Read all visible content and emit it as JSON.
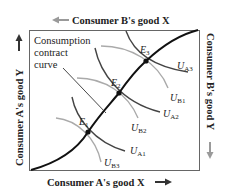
{
  "diagram": {
    "axes": {
      "bottom": {
        "label": "Consumer A's good X",
        "arrow": "right"
      },
      "top": {
        "label": "Consumer B's good X",
        "arrow": "left"
      },
      "left": {
        "label": "Consumer A's good Y",
        "arrow": "up"
      },
      "right": {
        "label": "Consumer B's good Y",
        "arrow": "down"
      }
    },
    "annotation": {
      "line1": "Consumption",
      "line2": "contract",
      "line3": "curve"
    },
    "points": [
      {
        "id": "E1",
        "label": "E",
        "sub": "1"
      },
      {
        "id": "E2",
        "label": "E",
        "sub": "2"
      },
      {
        "id": "E3",
        "label": "E",
        "sub": "3"
      }
    ],
    "indifference_curves": {
      "A": [
        {
          "label": "U",
          "sub": "A1"
        },
        {
          "label": "U",
          "sub": "A2"
        },
        {
          "label": "U",
          "sub": "A3"
        }
      ],
      "B": [
        {
          "label": "U",
          "sub": "B1"
        },
        {
          "label": "U",
          "sub": "B2"
        },
        {
          "label": "U",
          "sub": "B3"
        }
      ]
    },
    "colors": {
      "contract_curve": "#111111",
      "consumer_a_curves": "#444444",
      "consumer_b_curves": "#aaaaaa",
      "box": "#555555",
      "gray_arrow": "#9a9a9a"
    }
  }
}
